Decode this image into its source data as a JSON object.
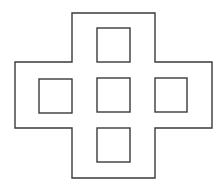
{
  "diagram": {
    "line_color": "#3a3a3a",
    "background": "#ffffff",
    "cross_outline": {
      "points": [
        [
          72,
          13
        ],
        [
          155,
          13
        ],
        [
          155,
          62
        ],
        [
          212,
          62
        ],
        [
          212,
          128
        ],
        [
          155,
          128
        ],
        [
          155,
          178
        ],
        [
          72,
          178
        ],
        [
          72,
          128
        ],
        [
          15,
          128
        ],
        [
          15,
          62
        ],
        [
          72,
          62
        ]
      ]
    },
    "squares": [
      {
        "name": "top",
        "x": 97,
        "y": 28,
        "w": 33,
        "h": 34
      },
      {
        "name": "left",
        "x": 39,
        "y": 79,
        "w": 33,
        "h": 34
      },
      {
        "name": "center",
        "x": 97,
        "y": 78,
        "w": 33,
        "h": 34
      },
      {
        "name": "right",
        "x": 155,
        "y": 78,
        "w": 32,
        "h": 34
      },
      {
        "name": "bottom",
        "x": 97,
        "y": 128,
        "w": 33,
        "h": 34
      }
    ]
  }
}
